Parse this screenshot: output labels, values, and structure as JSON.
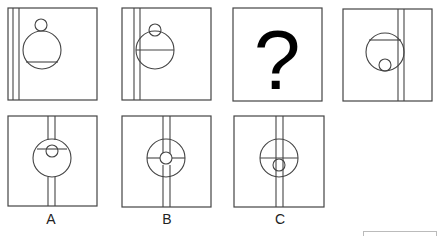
{
  "puzzle": {
    "question_row": [
      {
        "id": "panel-1",
        "content": "big circle with small circle above, chord near bottom, double vertical line at left"
      },
      {
        "id": "panel-2",
        "content": "big circle with small circle overlapping top, diameter chord, double vertical line at left"
      },
      {
        "id": "panel-3",
        "content": "question mark",
        "symbol": "?"
      },
      {
        "id": "panel-4",
        "content": "big circle with chord near top, small circle inside at bottom, double vertical line at right"
      }
    ],
    "options": [
      {
        "id": "A",
        "label": "A"
      },
      {
        "id": "B",
        "label": "B"
      },
      {
        "id": "C",
        "label": "C"
      }
    ]
  },
  "colors": {
    "stroke": "#444444",
    "background": "#ffffff",
    "cut_box": "#bbbbbb"
  }
}
